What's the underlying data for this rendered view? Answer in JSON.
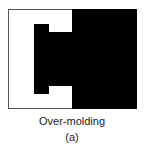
{
  "figure": {
    "caption": "Over-molding",
    "label": "(a)",
    "colors": {
      "background": "#ffffff",
      "fill": "#000000",
      "border": "#555555"
    },
    "shapes": [
      {
        "name": "outer-mold-block",
        "description": "right black rectangle forming over-molded region"
      },
      {
        "name": "inner-insert",
        "description": "black C-shaped inner insert with top and bottom notches"
      }
    ]
  }
}
